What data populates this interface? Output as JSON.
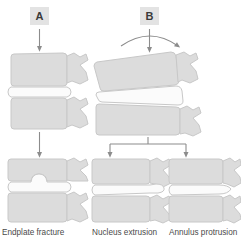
{
  "figure": {
    "panels": [
      {
        "id": "A",
        "label": "A"
      },
      {
        "id": "B",
        "label": "B"
      }
    ],
    "captions": [
      {
        "id": "endplate-fracture",
        "text": "Endplate fracture"
      },
      {
        "id": "nucleus-extrusion",
        "text": "Nucleus extrusion"
      },
      {
        "id": "annulus-protrusion",
        "text": "Annulus protrusion"
      }
    ],
    "colors": {
      "bone_fill": "#dcdcdc",
      "bone_stroke": "#c2c2c2",
      "disc_fill": "#fbfbfb",
      "disc_stroke": "#c8c8c8",
      "arrow": "#8c8c8c",
      "label_box_bg": "#e3e3e3",
      "label_text": "#3a3a3a",
      "caption_text": "#4a4a4a",
      "background": "#ffffff"
    },
    "diagrams": [
      {
        "id": "panel-a-intact-segment",
        "panel": "A",
        "description": "Two lumbar vertebrae with intervertebral disc, axial compression arrow from above"
      },
      {
        "id": "panel-b-flexed-segment",
        "panel": "B",
        "description": "Two lumbar vertebrae in flexion with wedged disc, curved flexion arrow plus axial load arrow"
      },
      {
        "id": "endplate-fracture-result",
        "panel": "A",
        "description": "Vertebral segment showing endplate fracture with disc material pressed into superior vertebral body"
      },
      {
        "id": "nucleus-extrusion-result",
        "panel": "B",
        "description": "Vertebral segment showing posterior nucleus extrusion through annulus"
      },
      {
        "id": "annulus-protrusion-result",
        "panel": "B",
        "description": "Vertebral segment showing broad-based posterior annulus protrusion"
      }
    ],
    "arrows": [
      {
        "id": "arrow-a-load",
        "type": "straight-down",
        "from": "A",
        "to": "panel-a-intact-segment"
      },
      {
        "id": "arrow-a-outcome",
        "type": "straight-down",
        "from": "panel-a-intact-segment",
        "to": "endplate-fracture-result"
      },
      {
        "id": "arrow-b-flexion",
        "type": "curved",
        "from": "B",
        "to": "panel-b-flexed-segment"
      },
      {
        "id": "arrow-b-load",
        "type": "straight-down",
        "from": "B",
        "to": "panel-b-flexed-segment"
      },
      {
        "id": "arrow-b-branch-left",
        "type": "branch-down",
        "from": "panel-b-flexed-segment",
        "to": "nucleus-extrusion-result"
      },
      {
        "id": "arrow-b-branch-right",
        "type": "branch-down",
        "from": "panel-b-flexed-segment",
        "to": "annulus-protrusion-result"
      }
    ]
  }
}
